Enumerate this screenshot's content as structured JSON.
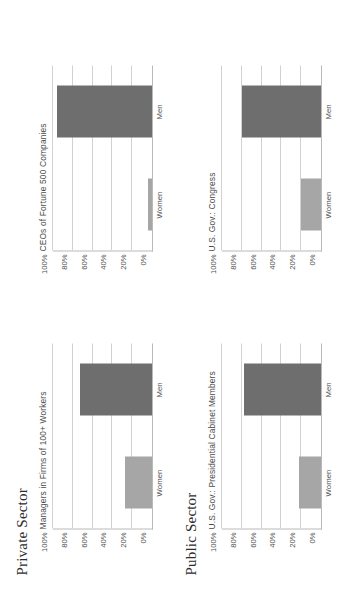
{
  "figure": {
    "orientation": "rotated-90-ccw",
    "background": "#ffffff",
    "sections": [
      {
        "id": "private",
        "title": "Private Sector"
      },
      {
        "id": "public",
        "title": "Public Sector"
      }
    ],
    "colors": {
      "men_bar": "#6e6e6e",
      "women_bar": "#a6a6a6",
      "gridline": "#d2d2d2",
      "axis": "#b9b9b9",
      "tick_text": "#4f4f4f",
      "panel_title_text": "#4a4a4a",
      "section_title_text": "#2e2e2e"
    },
    "footer_mark": ""
  },
  "axis": {
    "ticks": [
      "100%",
      "80%",
      "60%",
      "40%",
      "20%",
      "0%"
    ],
    "tick_values": [
      100,
      80,
      60,
      40,
      20,
      0
    ],
    "min": 0,
    "max": 100
  },
  "categories": [
    "Women",
    "Men"
  ],
  "panels": {
    "managers": {
      "title": "Managers in Firms of 100+ Workers",
      "women_label": "Women",
      "men_label": "Men",
      "women_value": 27,
      "men_value": 73
    },
    "ceos": {
      "title": "CEOs of Fortune 500 Companies",
      "women_label": "Women",
      "men_label": "Men",
      "women_value": 4,
      "men_value": 96
    },
    "cabinet": {
      "title": "U.S. Gov.: Presidential Cabinet Members",
      "women_label": "Women",
      "men_label": "Men",
      "women_value": 22,
      "men_value": 78
    },
    "congress": {
      "title": "U.S. Gov.: Congress",
      "women_label": "Women",
      "men_label": "Men",
      "women_value": 20,
      "men_value": 80
    }
  },
  "chart_data": [
    {
      "type": "bar",
      "id": "managers",
      "section": "Private Sector",
      "title": "Managers in Firms of 100+ Workers",
      "categories": [
        "Women",
        "Men"
      ],
      "values": [
        27,
        73
      ],
      "xlabel": "",
      "ylabel": "",
      "ylim": [
        0,
        100
      ],
      "yticks": [
        0,
        20,
        40,
        60,
        80,
        100
      ],
      "ytick_labels": [
        "0%",
        "20%",
        "40%",
        "60%",
        "80%",
        "100%"
      ],
      "grid": true,
      "legend": "none",
      "bar_colors": [
        "#a6a6a6",
        "#6e6e6e"
      ]
    },
    {
      "type": "bar",
      "id": "ceos",
      "section": "Private Sector",
      "title": "CEOs of Fortune 500 Companies",
      "categories": [
        "Women",
        "Men"
      ],
      "values": [
        4,
        96
      ],
      "xlabel": "",
      "ylabel": "",
      "ylim": [
        0,
        100
      ],
      "yticks": [
        0,
        20,
        40,
        60,
        80,
        100
      ],
      "ytick_labels": [
        "0%",
        "20%",
        "40%",
        "60%",
        "80%",
        "100%"
      ],
      "grid": true,
      "legend": "none",
      "bar_colors": [
        "#a6a6a6",
        "#6e6e6e"
      ]
    },
    {
      "type": "bar",
      "id": "cabinet",
      "section": "Public Sector",
      "title": "U.S. Gov.: Presidential Cabinet Members",
      "categories": [
        "Women",
        "Men"
      ],
      "values": [
        22,
        78
      ],
      "xlabel": "",
      "ylabel": "",
      "ylim": [
        0,
        100
      ],
      "yticks": [
        0,
        20,
        40,
        60,
        80,
        100
      ],
      "ytick_labels": [
        "0%",
        "20%",
        "40%",
        "60%",
        "80%",
        "100%"
      ],
      "grid": true,
      "legend": "none",
      "bar_colors": [
        "#a6a6a6",
        "#6e6e6e"
      ]
    },
    {
      "type": "bar",
      "id": "congress",
      "section": "Public Sector",
      "title": "U.S. Gov.: Congress",
      "categories": [
        "Women",
        "Men"
      ],
      "values": [
        20,
        80
      ],
      "xlabel": "",
      "ylabel": "",
      "ylim": [
        0,
        100
      ],
      "yticks": [
        0,
        20,
        40,
        60,
        80,
        100
      ],
      "ytick_labels": [
        "0%",
        "20%",
        "40%",
        "60%",
        "80%",
        "100%"
      ],
      "grid": true,
      "legend": "none",
      "bar_colors": [
        "#a6a6a6",
        "#6e6e6e"
      ]
    }
  ]
}
